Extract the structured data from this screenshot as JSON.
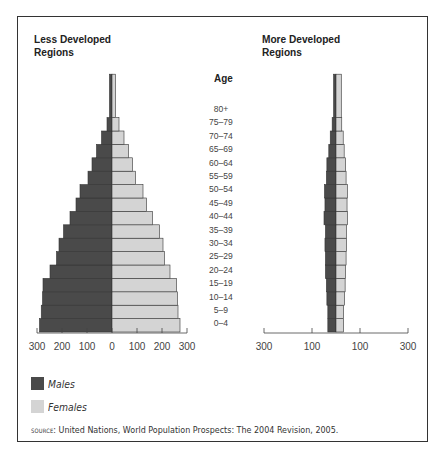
{
  "chart_data": [
    {
      "type": "bar",
      "subtype": "population-pyramid",
      "title": "Less Developed Regions",
      "ylabel": "Age",
      "categories": [
        "0–4",
        "5–9",
        "10–14",
        "15–19",
        "20–24",
        "25–29",
        "30–34",
        "35–39",
        "40–44",
        "45–49",
        "50–54",
        "55–59",
        "60–64",
        "65–69",
        "70–74",
        "75–79",
        "80+"
      ],
      "series": [
        {
          "name": "Males",
          "values": [
            290,
            283,
            278,
            276,
            248,
            222,
            212,
            194,
            168,
            144,
            128,
            96,
            80,
            62,
            42,
            20,
            10
          ]
        },
        {
          "name": "Females",
          "values": [
            272,
            264,
            262,
            258,
            232,
            210,
            204,
            190,
            162,
            138,
            124,
            94,
            82,
            66,
            48,
            28,
            14
          ]
        }
      ],
      "xticks": [
        "300",
        "200",
        "100",
        "0",
        "100",
        "200",
        "300"
      ],
      "xlim": [
        -300,
        300
      ],
      "xlabel": ""
    },
    {
      "type": "bar",
      "subtype": "population-pyramid",
      "title": "More Developed Regions",
      "ylabel": "Age",
      "categories": [
        "0–4",
        "5–9",
        "10–14",
        "15–19",
        "20–24",
        "25–29",
        "30–34",
        "35–39",
        "40–44",
        "45–49",
        "50–54",
        "55–59",
        "60–64",
        "65–69",
        "70–74",
        "75–79",
        "80+"
      ],
      "series": [
        {
          "name": "Males",
          "values": [
            34,
            34,
            38,
            40,
            44,
            44,
            46,
            44,
            50,
            46,
            48,
            40,
            38,
            30,
            24,
            16,
            10
          ]
        },
        {
          "name": "Females",
          "values": [
            32,
            32,
            36,
            38,
            40,
            42,
            44,
            44,
            48,
            46,
            48,
            42,
            40,
            34,
            30,
            24,
            22
          ]
        }
      ],
      "xticks": [
        "300",
        "100",
        "100",
        "300"
      ],
      "xlim": [
        -300,
        300
      ],
      "xlabel": ""
    }
  ],
  "left_panel": {
    "title_line1": "Less Developed",
    "title_line2": "Regions"
  },
  "right_panel": {
    "title_line1": "More Developed",
    "title_line2": "Regions"
  },
  "age_axis": {
    "title": "Age",
    "labels": [
      "80+",
      "75–79",
      "70–74",
      "65–69",
      "60–64",
      "55–59",
      "50–54",
      "45–49",
      "40–44",
      "35–39",
      "30–34",
      "25–29",
      "20–24",
      "15–19",
      "10–14",
      "5–9",
      "0–4"
    ]
  },
  "legend": {
    "males": {
      "label": "Males",
      "color": "#4a4a4a"
    },
    "females": {
      "label": "Females",
      "color": "#d4d4d4"
    }
  },
  "source": {
    "prefix": "source",
    "text": ": United Nations, World Population Prospects: The 2004 Revision, 2005."
  },
  "colors": {
    "male": "#4a4a4a",
    "female": "#d4d4d4",
    "outline": "#333333"
  }
}
